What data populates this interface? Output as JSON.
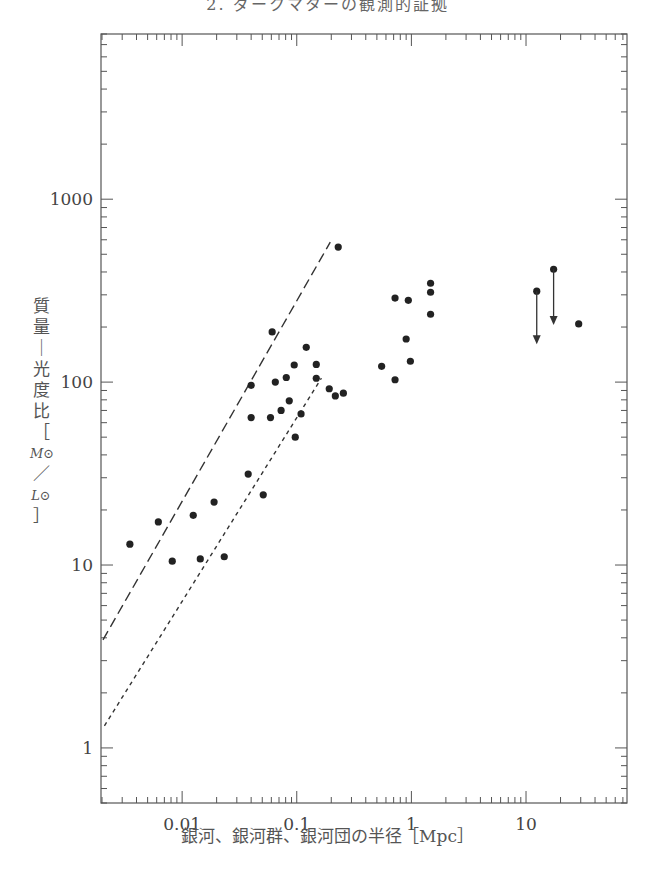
{
  "header": {
    "title": "2. ダークマターの観測的証拠"
  },
  "chart_data": {
    "type": "scatter",
    "title": "",
    "xlabel": "銀河、銀河群、銀河団の半径［Mpc］",
    "ylabel": "質量－光度比［M⊙/L⊙］",
    "ylabel_chars": [
      "質",
      "量",
      "｜",
      "光",
      "度",
      "比",
      "［",
      "M⊙",
      "／",
      "L⊙",
      "］"
    ],
    "xscale": "log",
    "yscale": "log",
    "xlim": [
      0.00196,
      76
    ],
    "ylim": [
      0.5,
      8000
    ],
    "x_ticks": [
      0.01,
      0.1,
      1,
      10
    ],
    "x_tick_labels": [
      "0.01",
      "0.1",
      "1",
      "10"
    ],
    "y_ticks": [
      1,
      10,
      100,
      1000
    ],
    "y_tick_labels": [
      "1",
      "10",
      "100",
      "1000"
    ],
    "grid": false,
    "legend": null,
    "points": [
      {
        "x": 0.0035,
        "y": 13.0
      },
      {
        "x": 0.0062,
        "y": 17.2
      },
      {
        "x": 0.0082,
        "y": 10.5
      },
      {
        "x": 0.0125,
        "y": 18.7
      },
      {
        "x": 0.0144,
        "y": 10.8
      },
      {
        "x": 0.019,
        "y": 22.1
      },
      {
        "x": 0.0233,
        "y": 11.1
      },
      {
        "x": 0.0377,
        "y": 31.4
      },
      {
        "x": 0.051,
        "y": 24.2
      },
      {
        "x": 0.04,
        "y": 96
      },
      {
        "x": 0.04,
        "y": 64
      },
      {
        "x": 0.061,
        "y": 188
      },
      {
        "x": 0.065,
        "y": 100
      },
      {
        "x": 0.081,
        "y": 106
      },
      {
        "x": 0.095,
        "y": 124
      },
      {
        "x": 0.121,
        "y": 155
      },
      {
        "x": 0.148,
        "y": 125
      },
      {
        "x": 0.148,
        "y": 105
      },
      {
        "x": 0.059,
        "y": 64
      },
      {
        "x": 0.073,
        "y": 70
      },
      {
        "x": 0.086,
        "y": 79
      },
      {
        "x": 0.109,
        "y": 67
      },
      {
        "x": 0.097,
        "y": 50
      },
      {
        "x": 0.192,
        "y": 92
      },
      {
        "x": 0.217,
        "y": 84
      },
      {
        "x": 0.255,
        "y": 87
      },
      {
        "x": 0.23,
        "y": 547
      },
      {
        "x": 0.55,
        "y": 122
      },
      {
        "x": 0.72,
        "y": 103
      },
      {
        "x": 0.72,
        "y": 288
      },
      {
        "x": 0.94,
        "y": 280
      },
      {
        "x": 0.9,
        "y": 172
      },
      {
        "x": 0.98,
        "y": 130
      },
      {
        "x": 1.47,
        "y": 347
      },
      {
        "x": 1.47,
        "y": 310
      },
      {
        "x": 1.47,
        "y": 235
      },
      {
        "x": 28.8,
        "y": 208
      }
    ],
    "upper_limits": [
      {
        "x": 12.4,
        "y": 314,
        "arrow_to": 161
      },
      {
        "x": 17.4,
        "y": 414,
        "arrow_to": 205
      }
    ],
    "lines": [
      {
        "name": "long-dash",
        "style": "long-dash",
        "x": [
          0.00204,
          0.196
        ],
        "y": [
          3.9,
          582
        ]
      },
      {
        "name": "short-dash",
        "style": "short-dash",
        "x": [
          0.0021,
          0.164
        ],
        "y": [
          1.32,
          105
        ]
      }
    ]
  },
  "colors": {
    "ink": "#222222",
    "axis": "#555555",
    "text": "#555555"
  }
}
